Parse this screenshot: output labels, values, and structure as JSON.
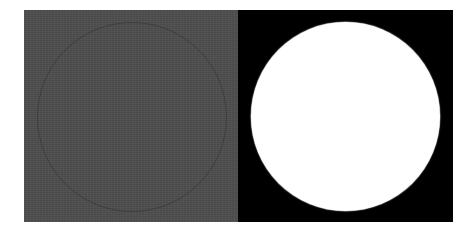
{
  "figure": {
    "panels": [
      {
        "id": "left",
        "background_color": "#4e4e4e",
        "shape": "circle",
        "shape_style": "faint-outline",
        "outline_color": "#3a3a3a"
      },
      {
        "id": "right",
        "background_color": "#000000",
        "shape": "circle",
        "shape_style": "filled",
        "fill_color": "#ffffff"
      }
    ]
  }
}
